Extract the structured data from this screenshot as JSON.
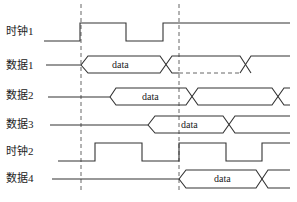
{
  "diagram": {
    "type": "timing-diagram",
    "signals": [
      {
        "id": "clk1",
        "label": "时钟1",
        "kind": "clock"
      },
      {
        "id": "data1",
        "label": "数据1",
        "kind": "bus",
        "bus_text": "data"
      },
      {
        "id": "data2",
        "label": "数据2",
        "kind": "bus",
        "bus_text": "data"
      },
      {
        "id": "data3",
        "label": "数据3",
        "kind": "bus",
        "bus_text": "data"
      },
      {
        "id": "clk2",
        "label": "时钟2",
        "kind": "clock"
      },
      {
        "id": "data4",
        "label": "数据4",
        "kind": "bus",
        "bus_text": "data"
      }
    ],
    "reference_lines": [
      {
        "id": "ref1",
        "style": "dashed"
      },
      {
        "id": "ref2",
        "style": "dashed"
      }
    ],
    "colors": {
      "line": "#333333",
      "dashed": "#555555",
      "background": "#ffffff"
    }
  }
}
